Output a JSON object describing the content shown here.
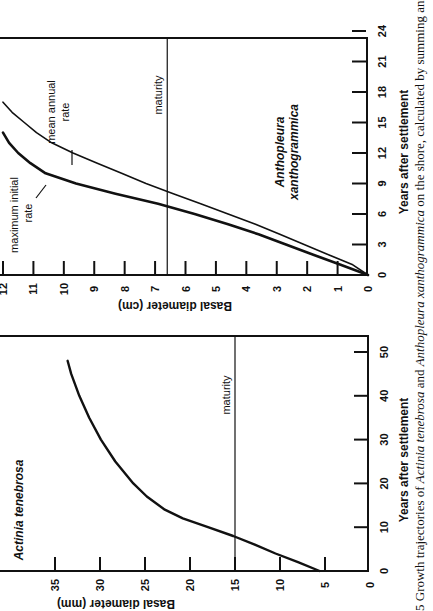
{
  "figure": {
    "orientation": "rotated-90-ccw",
    "caption": "5 Growth trajectories of Actinia tenebrosa and Anthopleura xanthogrammica on the shore, calculated by summing annu",
    "caption_parts": {
      "prefix": "5 Growth trajectories of ",
      "species_a": "Actinia tenebrosa",
      "mid": " and ",
      "species_b": "Anthopleura xanthogrammica",
      "suffix": " on the shore, calculated by summing annu"
    }
  },
  "chart_data": [
    {
      "id": "anthopleura",
      "type": "line",
      "title": "Anthopleura xanthogrammica",
      "title_lines": [
        "Anthopleura",
        "xanthogrammica"
      ],
      "xlabel": "Years after settlement",
      "ylabel": "Basal diameter (cm)",
      "xlim": [
        0,
        25
      ],
      "ylim": [
        0,
        12
      ],
      "xticks": [
        0,
        3,
        6,
        9,
        12,
        15,
        18,
        21,
        24
      ],
      "yticks": [
        0,
        1,
        2,
        3,
        4,
        5,
        6,
        7,
        8,
        9,
        10,
        11,
        12
      ],
      "grid": false,
      "legend": "inline annotations",
      "reference_lines": [
        {
          "axis": "y",
          "value": 6.6,
          "label": "maturity"
        }
      ],
      "series": [
        {
          "name": "maximum initial rate",
          "label_lines": [
            "maximum initial",
            "rate"
          ],
          "stroke_width": 2.6,
          "x": [
            0,
            1,
            2,
            3,
            4,
            5,
            6,
            7,
            8,
            9,
            10,
            11,
            12,
            13,
            14
          ],
          "y": [
            0,
            0.9,
            1.8,
            2.7,
            3.6,
            4.6,
            5.7,
            6.9,
            8.3,
            9.6,
            10.6,
            11.1,
            11.5,
            11.8,
            12.0
          ]
        },
        {
          "name": "mean annual rate",
          "label_lines": [
            "mean annual",
            "rate"
          ],
          "stroke_width": 1.6,
          "x": [
            0,
            1,
            2,
            3,
            4,
            5,
            6,
            7,
            8,
            9,
            10,
            11,
            12,
            13,
            14,
            15,
            16,
            17
          ],
          "y": [
            0,
            0.5,
            1.3,
            2.1,
            2.9,
            3.7,
            4.6,
            5.5,
            6.4,
            7.3,
            8.1,
            8.9,
            9.7,
            10.4,
            10.9,
            11.3,
            11.7,
            12.0
          ]
        }
      ]
    },
    {
      "id": "actinia",
      "type": "line",
      "title": "Actinia tenebrosa",
      "xlabel": "Years after settlement",
      "ylabel": "Basal diameter (mm)",
      "xlim": [
        0,
        53
      ],
      "ylim": [
        0,
        40
      ],
      "xticks": [
        0,
        10,
        20,
        30,
        40,
        50
      ],
      "yticks": [
        0,
        5,
        10,
        15,
        20,
        25,
        30,
        35
      ],
      "grid": false,
      "reference_lines": [
        {
          "axis": "y",
          "value": 15,
          "label": "maturity"
        }
      ],
      "series": [
        {
          "name": "Actinia tenebrosa",
          "stroke_width": 2.4,
          "x": [
            0,
            2,
            4,
            6,
            8,
            10,
            12,
            14,
            17,
            20,
            25,
            30,
            35,
            40,
            45,
            48
          ],
          "y": [
            5.6,
            8.0,
            10.5,
            12.8,
            15.2,
            18.0,
            20.8,
            22.8,
            24.8,
            26.3,
            28.3,
            29.9,
            31.2,
            32.3,
            33.2,
            33.6
          ]
        }
      ]
    }
  ]
}
